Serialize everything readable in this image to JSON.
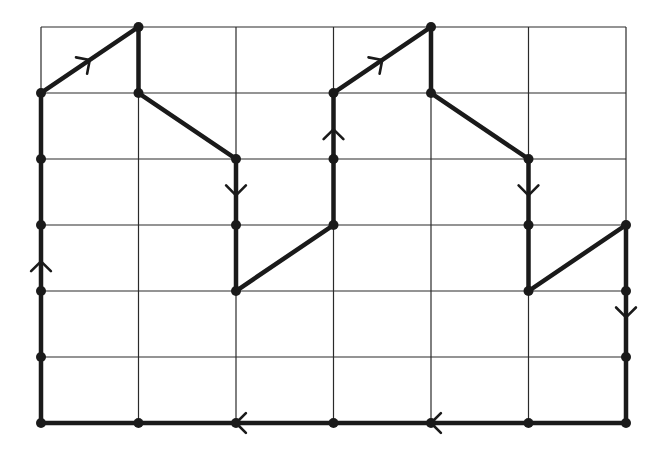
{
  "diagram": {
    "type": "grid-path",
    "grid": {
      "columns": 6,
      "rows": 6,
      "x_lines": [
        41,
        138.5,
        236,
        333.5,
        431,
        528.5,
        626
      ],
      "y_lines": [
        27,
        93,
        159,
        225,
        291,
        357,
        423
      ]
    },
    "colors": {
      "grid": "#2a2a2a",
      "path": "#1a1a1a",
      "background": "#ffffff"
    },
    "path_points": [
      [
        0,
        6
      ],
      [
        0,
        5
      ],
      [
        0,
        4
      ],
      [
        0,
        3
      ],
      [
        0,
        2
      ],
      [
        0,
        1
      ],
      [
        1,
        0
      ],
      [
        1,
        1
      ],
      [
        2,
        2
      ],
      [
        2,
        3
      ],
      [
        2,
        4
      ],
      [
        3,
        3
      ],
      [
        3,
        2
      ],
      [
        3,
        1
      ],
      [
        4,
        0
      ],
      [
        4,
        1
      ],
      [
        5,
        2
      ],
      [
        5,
        3
      ],
      [
        5,
        4
      ],
      [
        6,
        3
      ],
      [
        6,
        4
      ],
      [
        6,
        5
      ],
      [
        6,
        6
      ],
      [
        5,
        6
      ],
      [
        4,
        6
      ],
      [
        3,
        6
      ],
      [
        2,
        6
      ],
      [
        1,
        6
      ],
      [
        0,
        6
      ]
    ],
    "arrows": [
      {
        "label": "up-arrow-left-edge",
        "col": 0,
        "row": 3.55,
        "dir": "up"
      },
      {
        "label": "diag-arrow-1",
        "col": 0.5,
        "row": 0.5,
        "dir": "up-right"
      },
      {
        "label": "down-arrow-col2",
        "col": 2,
        "row": 2.55,
        "dir": "down"
      },
      {
        "label": "up-arrow-col3",
        "col": 3,
        "row": 1.55,
        "dir": "up"
      },
      {
        "label": "diag-arrow-2",
        "col": 3.5,
        "row": 0.5,
        "dir": "up-right"
      },
      {
        "label": "down-arrow-col5",
        "col": 5,
        "row": 2.55,
        "dir": "down"
      },
      {
        "label": "down-arrow-right-edge",
        "col": 6,
        "row": 4.4,
        "dir": "down"
      },
      {
        "label": "left-arrow-bottom-1",
        "col": 4,
        "row": 6,
        "dir": "left"
      },
      {
        "label": "left-arrow-bottom-2",
        "col": 2,
        "row": 6,
        "dir": "left"
      }
    ]
  }
}
